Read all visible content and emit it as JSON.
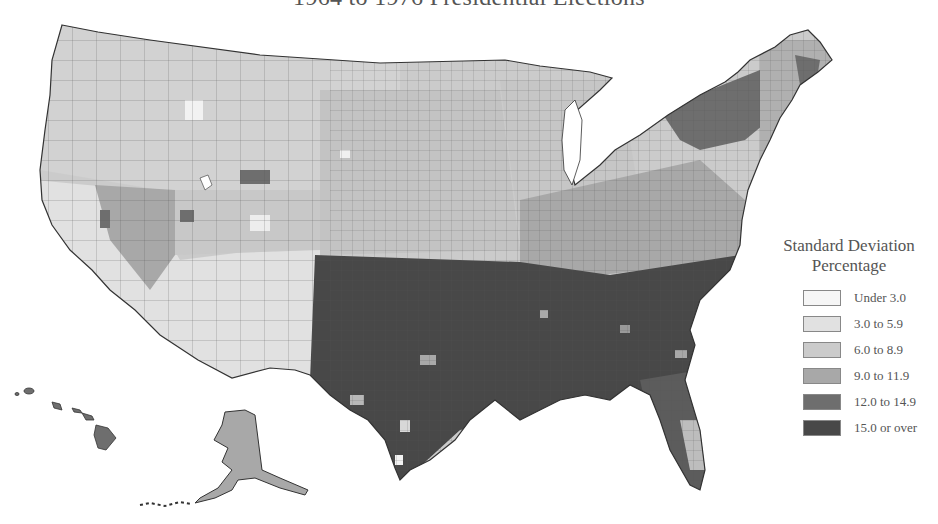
{
  "title": "1964 to 1976 Presidential Elections",
  "legend": {
    "title_line1": "Standard Deviation",
    "title_line2": "Percentage",
    "items": [
      {
        "label": "Under 3.0",
        "color": "#f6f6f6"
      },
      {
        "label": "3.0 to 5.9",
        "color": "#e1e1e1"
      },
      {
        "label": "6.0 to 8.9",
        "color": "#cbcbcb"
      },
      {
        "label": "9.0 to 11.9",
        "color": "#a8a8a8"
      },
      {
        "label": "12.0 to 14.9",
        "color": "#6e6e6e"
      },
      {
        "label": "15.0 or over",
        "color": "#484848"
      }
    ]
  },
  "map": {
    "subject": "United States counties",
    "regions_shown": [
      "Contiguous United States",
      "Alaska",
      "Hawaii"
    ],
    "region_shading": {
      "Pacific Northwest": "6.0 to 8.9",
      "California": "3.0 to 5.9",
      "Nevada": "9.0 to 11.9",
      "Southwest (Arizona, New Mexico)": "3.0 to 5.9",
      "Mountain West": "6.0 to 8.9",
      "Great Plains": "6.0 to 8.9",
      "Midwest": "6.0 to 8.9",
      "Texas": "15.0 or over",
      "Deep South": "15.0 or over",
      "Florida": "12.0 to 14.9",
      "Appalachia / Mid-Atlantic": "9.0 to 11.9",
      "Upstate New York / Vermont": "12.0 to 14.9",
      "New England": "9.0 to 11.9",
      "Alaska": "9.0 to 11.9",
      "Hawaii": "12.0 to 14.9"
    }
  }
}
